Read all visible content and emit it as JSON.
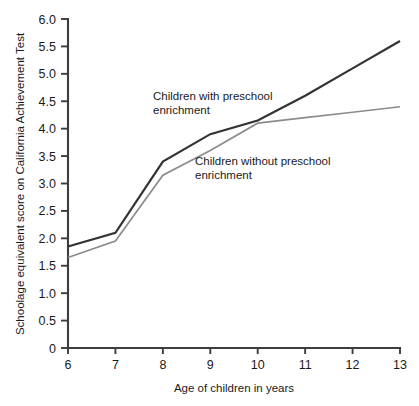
{
  "chart_data": {
    "type": "line",
    "title": "",
    "xlabel": "Age of children in years",
    "ylabel": "Schoolage equivalent score on California Achievement Test",
    "x": [
      6,
      7,
      8,
      9,
      10,
      11,
      12,
      13
    ],
    "xticklabels": [
      "6",
      "7",
      "8",
      "9",
      "10",
      "11",
      "12",
      "13"
    ],
    "yticklabels": [
      "0",
      "0.5",
      "1.0",
      "1.5",
      "2.0",
      "2.5",
      "3.0",
      "3.5",
      "4.0",
      "4.5",
      "5.0",
      "5.5",
      "6.0"
    ],
    "yticks": [
      0,
      0.5,
      1.0,
      1.5,
      2.0,
      2.5,
      3.0,
      3.5,
      4.0,
      4.5,
      5.0,
      5.5,
      6.0
    ],
    "xlim": [
      6,
      13
    ],
    "ylim": [
      0,
      6.0
    ],
    "grid": false,
    "legend": "inline-annotations",
    "series": [
      {
        "name": "Children with preschool enrichment",
        "color": "#333333",
        "width": 2.2,
        "values": [
          1.85,
          2.1,
          3.4,
          3.9,
          4.15,
          4.6,
          5.1,
          5.6
        ]
      },
      {
        "name": "Children without preschool enrichment",
        "color": "#8c8c8c",
        "width": 1.7,
        "values": [
          1.65,
          1.95,
          3.15,
          3.6,
          4.1,
          4.2,
          4.3,
          4.4
        ]
      }
    ],
    "annotations": [
      {
        "id": "with-enrichment",
        "lines": [
          "Children with preschool",
          "enrichment"
        ],
        "x": 153,
        "y": 100
      },
      {
        "id": "without-enrichment",
        "lines": [
          "Children without preschool",
          "enrichment"
        ],
        "x": 195,
        "y": 165
      }
    ]
  },
  "plot_area": {
    "left": 68,
    "right": 400,
    "top": 19,
    "bottom": 348
  }
}
